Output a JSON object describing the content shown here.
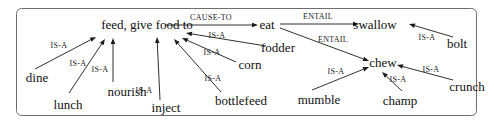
{
  "diagram": {
    "nodes": [
      {
        "id": "feed",
        "label": "feed, give food to",
        "x": 147,
        "y": 25
      },
      {
        "id": "eat",
        "label": "eat",
        "x": 267,
        "y": 25
      },
      {
        "id": "swallow",
        "label": "swallow",
        "x": 375,
        "y": 25
      },
      {
        "id": "bolt",
        "label": "bolt",
        "x": 457,
        "y": 44
      },
      {
        "id": "chew",
        "label": "chew",
        "x": 383,
        "y": 63
      },
      {
        "id": "fodder",
        "label": "fodder",
        "x": 278,
        "y": 48
      },
      {
        "id": "corn",
        "label": "corn",
        "x": 250,
        "y": 65
      },
      {
        "id": "dine",
        "label": "dine",
        "x": 37,
        "y": 78
      },
      {
        "id": "nourish",
        "label": "nourish",
        "x": 127,
        "y": 92
      },
      {
        "id": "lunch",
        "label": "lunch",
        "x": 68,
        "y": 105
      },
      {
        "id": "inject",
        "label": "inject",
        "x": 166,
        "y": 108
      },
      {
        "id": "bottlefeed",
        "label": "bottlefeed",
        "x": 241,
        "y": 101
      },
      {
        "id": "mumble",
        "label": "mumble",
        "x": 319,
        "y": 100
      },
      {
        "id": "champ",
        "label": "champ",
        "x": 400,
        "y": 101
      },
      {
        "id": "crunch",
        "label": "crunch",
        "x": 467,
        "y": 87
      }
    ],
    "edges": [
      {
        "from": "feed",
        "to": "eat",
        "label": "CAUSE-TO",
        "x1": 165,
        "y1": 25,
        "x2": 258,
        "y2": 25,
        "lx": 211,
        "ly": 20
      },
      {
        "from": "eat",
        "to": "swallow",
        "label": "ENTAIL",
        "x1": 280,
        "y1": 24,
        "x2": 359,
        "y2": 24,
        "lx": 318,
        "ly": 19
      },
      {
        "from": "eat",
        "to": "chew",
        "label": "ENTAIL",
        "x1": 280,
        "y1": 28,
        "x2": 369,
        "y2": 61,
        "lx": 333,
        "ly": 42
      },
      {
        "from": "bolt",
        "to": "swallow",
        "label": "IS-A",
        "x1": 453,
        "y1": 37,
        "x2": 409,
        "y2": 24,
        "lx": 427,
        "ly": 40
      },
      {
        "from": "crunch",
        "to": "chew",
        "label": "IS-A",
        "x1": 453,
        "y1": 80,
        "x2": 397,
        "y2": 65,
        "lx": 431,
        "ly": 72
      },
      {
        "from": "champ",
        "to": "chew",
        "label": "IS-A",
        "x1": 402,
        "y1": 91,
        "x2": 382,
        "y2": 72,
        "lx": 398,
        "ly": 82
      },
      {
        "from": "mumble",
        "to": "chew",
        "label": "IS-A",
        "x1": 312,
        "y1": 90,
        "x2": 369,
        "y2": 67,
        "lx": 336,
        "ly": 74
      },
      {
        "from": "fodder",
        "to": "feed",
        "label": "IS-A",
        "x1": 266,
        "y1": 46,
        "x2": 186,
        "y2": 33,
        "lx": 217,
        "ly": 38
      },
      {
        "from": "corn",
        "to": "feed",
        "label": "IS-A",
        "x1": 236,
        "y1": 62,
        "x2": 182,
        "y2": 38,
        "lx": 212,
        "ly": 55
      },
      {
        "from": "bottlefeed",
        "to": "feed",
        "label": "IS-A",
        "x1": 221,
        "y1": 92,
        "x2": 174,
        "y2": 39,
        "lx": 213,
        "ly": 81
      },
      {
        "from": "inject",
        "to": "feed",
        "label": "IS-A",
        "x1": 160,
        "y1": 100,
        "x2": 157,
        "y2": 37,
        "lx": 144,
        "ly": 93
      },
      {
        "from": "nourish",
        "to": "feed",
        "label": "IS-A",
        "x1": 113,
        "y1": 82,
        "x2": 113,
        "y2": 38,
        "lx": 100,
        "ly": 72
      },
      {
        "from": "lunch",
        "to": "feed",
        "label": "IS-A",
        "x1": 69,
        "y1": 93,
        "x2": 105,
        "y2": 39,
        "lx": 78,
        "ly": 66
      },
      {
        "from": "dine",
        "to": "feed",
        "label": "IS-A",
        "x1": 35,
        "y1": 69,
        "x2": 96,
        "y2": 37,
        "lx": 59,
        "ly": 48
      }
    ]
  }
}
